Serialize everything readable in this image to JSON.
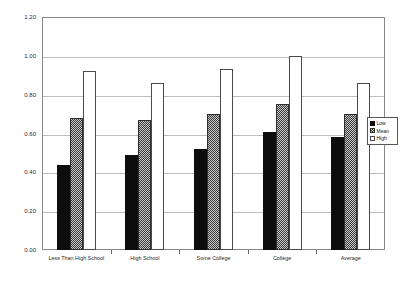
{
  "chart_data": {
    "type": "bar",
    "title": "",
    "xlabel": "",
    "ylabel": "Female/Male Hourly Wage Ratio",
    "ylim": [
      0.0,
      1.2
    ],
    "ytick_labels": [
      "1.20",
      "1.00",
      "0.80",
      "0.60",
      "0.40",
      "0.20",
      "0.00"
    ],
    "ytick_values": [
      1.2,
      1.0,
      0.8,
      0.6,
      0.4,
      0.2,
      0.0
    ],
    "grid": true,
    "legend_position": "right",
    "categories": [
      "Less Than High School",
      "High School",
      "Some College",
      "College",
      "Average"
    ],
    "series": [
      {
        "name": "Low",
        "values": [
          0.44,
          0.49,
          0.52,
          0.61,
          0.58
        ]
      },
      {
        "name": "Mean",
        "values": [
          0.68,
          0.67,
          0.7,
          0.75,
          0.7
        ]
      },
      {
        "name": "High",
        "values": [
          0.92,
          0.86,
          0.93,
          1.0,
          0.86
        ]
      }
    ]
  },
  "legend": {
    "items": [
      {
        "label": "Low",
        "style": "low"
      },
      {
        "label": "Mean",
        "style": "mean"
      },
      {
        "label": "High",
        "style": "high"
      }
    ]
  },
  "colors": {
    "low": "#0d0d0d",
    "mean": "#c9c9c9",
    "high": "#ffffff",
    "frame": "#888888",
    "gridline": "#bdbdbd",
    "text": "#1f1f1f"
  }
}
